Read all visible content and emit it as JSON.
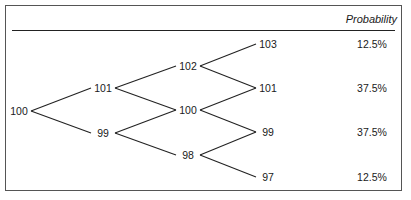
{
  "header": {
    "probability_label": "Probability"
  },
  "tree": {
    "nodes": {
      "n0": {
        "label": "100",
        "x": 19,
        "y": 111
      },
      "n1u": {
        "label": "101",
        "x": 103,
        "y": 88
      },
      "n1d": {
        "label": "99",
        "x": 103,
        "y": 133
      },
      "n2uu": {
        "label": "102",
        "x": 188,
        "y": 66
      },
      "n2ud": {
        "label": "100",
        "x": 188,
        "y": 110
      },
      "n2dd": {
        "label": "98",
        "x": 188,
        "y": 155
      },
      "n3a": {
        "label": "103",
        "x": 268,
        "y": 44
      },
      "n3b": {
        "label": "101",
        "x": 268,
        "y": 88
      },
      "n3c": {
        "label": "99",
        "x": 268,
        "y": 132
      },
      "n3d": {
        "label": "97",
        "x": 268,
        "y": 177
      }
    },
    "edges": [
      [
        "n0",
        "n1u"
      ],
      [
        "n0",
        "n1d"
      ],
      [
        "n1u",
        "n2uu"
      ],
      [
        "n1u",
        "n2ud"
      ],
      [
        "n1d",
        "n2ud"
      ],
      [
        "n1d",
        "n2dd"
      ],
      [
        "n2uu",
        "n3a"
      ],
      [
        "n2uu",
        "n3b"
      ],
      [
        "n2ud",
        "n3b"
      ],
      [
        "n2ud",
        "n3c"
      ],
      [
        "n2dd",
        "n3c"
      ],
      [
        "n2dd",
        "n3d"
      ]
    ]
  },
  "probabilities": [
    {
      "value": "12.5%",
      "y": 44
    },
    {
      "value": "37.5%",
      "y": 88
    },
    {
      "value": "37.5%",
      "y": 132
    },
    {
      "value": "12.5%",
      "y": 177
    }
  ]
}
